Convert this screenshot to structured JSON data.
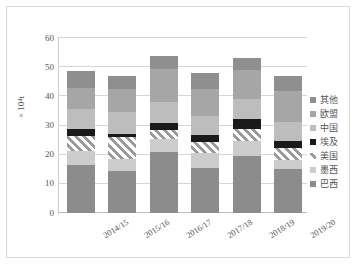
{
  "chart_data": {
    "type": "bar",
    "stacked": true,
    "title": "",
    "xlabel": "",
    "ylabel": "× 10⁴t",
    "ylim": [
      0,
      60
    ],
    "yticks": [
      0,
      10,
      20,
      30,
      40,
      50,
      60
    ],
    "grid": true,
    "legend_position": "right",
    "categories": [
      "2014/15",
      "2015/16",
      "2016/17",
      "2017/18",
      "2018/19",
      "2019/20"
    ],
    "series": [
      {
        "name": "巴西",
        "color": "#8c8c8c",
        "values": [
          16.6,
          14.3,
          20.8,
          15.4,
          19.4,
          15.0
        ]
      },
      {
        "name": "墨西",
        "color": "#cccccc",
        "values": [
          4.6,
          4.3,
          4.6,
          5.2,
          5.3,
          3.2
        ]
      },
      {
        "name": "美国",
        "color": "#9a9a9a",
        "hatch": "diagonal",
        "values": [
          5.3,
          7.3,
          3.2,
          3.9,
          4.1,
          4.1
        ]
      },
      {
        "name": "埃及",
        "color": "#1a1a1a",
        "values": [
          2.4,
          1.1,
          2.4,
          2.1,
          3.6,
          2.4
        ]
      },
      {
        "name": "中国",
        "color": "#bdbdbd",
        "values": [
          6.8,
          7.5,
          7.0,
          6.7,
          6.7,
          6.6
        ]
      },
      {
        "name": "欧盟",
        "color": "#a6a6a6",
        "values": [
          7.0,
          8.0,
          11.3,
          9.3,
          9.8,
          10.4
        ]
      },
      {
        "name": "其他",
        "color": "#8f8f8f",
        "values": [
          6.1,
          4.6,
          4.5,
          5.4,
          4.1,
          5.4
        ]
      }
    ],
    "bar_totals": [
      48.8,
      47.1,
      53.8,
      48.0,
      53.0,
      47.1
    ]
  },
  "legend": {
    "items": [
      {
        "label": "其他"
      },
      {
        "label": "欧盟"
      },
      {
        "label": "中国"
      },
      {
        "label": "埃及"
      },
      {
        "label": "美国"
      },
      {
        "label": "墨西"
      },
      {
        "label": "巴西"
      }
    ]
  }
}
